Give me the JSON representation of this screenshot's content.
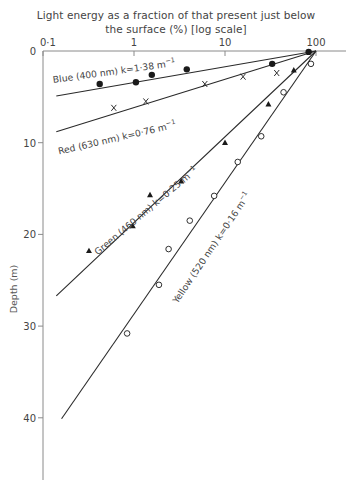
{
  "chart_data": {
    "type": "line",
    "title_lines": [
      "Light energy as a fraction of that present just below",
      "the surface (%) [log scale]"
    ],
    "xlabel": "Light energy as a fraction of that present just below the surface (%) [log scale]",
    "ylabel": "Depth (m)",
    "x_scale": "log",
    "x_axis_position": "top",
    "xlim": [
      0.1,
      100
    ],
    "ylim": [
      0,
      45
    ],
    "y_inverted": true,
    "x_ticks": [
      {
        "value": 0.1,
        "label": "0·1"
      },
      {
        "value": 1,
        "label": "1"
      },
      {
        "value": 10,
        "label": "10"
      },
      {
        "value": 100,
        "label": "100"
      }
    ],
    "y_ticks": [
      {
        "value": 0,
        "label": "0"
      },
      {
        "value": 10,
        "label": "10"
      },
      {
        "value": 20,
        "label": "20"
      },
      {
        "value": 30,
        "label": "30"
      },
      {
        "value": 40,
        "label": "40"
      }
    ],
    "grid": false,
    "legend": "inline labels along lines",
    "series": [
      {
        "name": "Blue (400 nm) k=1·38 m⁻¹",
        "label": "Blue (400 nm) k=1·38 m",
        "wavelength_nm": 400,
        "k_per_m": 1.38,
        "marker": "filled-circle",
        "fit_line": {
          "from": {
            "x": 0.14,
            "depth": 4.9
          },
          "to": {
            "x": 100,
            "depth": 0
          }
        },
        "points": [
          {
            "x": 0.42,
            "depth": 3.6
          },
          {
            "x": 1.05,
            "depth": 3.4
          },
          {
            "x": 1.57,
            "depth": 2.6
          },
          {
            "x": 3.8,
            "depth": 2.0
          },
          {
            "x": 33,
            "depth": 1.4
          },
          {
            "x": 83,
            "depth": 0.1
          }
        ]
      },
      {
        "name": "Red (630 nm) k=0·76 m⁻¹",
        "label": "Red (630 nm) k=0·76 m",
        "wavelength_nm": 630,
        "k_per_m": 0.76,
        "marker": "cross",
        "fit_line": {
          "from": {
            "x": 0.14,
            "depth": 8.8
          },
          "to": {
            "x": 100,
            "depth": 0
          }
        },
        "points": [
          {
            "x": 0.6,
            "depth": 6.2
          },
          {
            "x": 1.35,
            "depth": 5.5
          },
          {
            "x": 6.0,
            "depth": 3.6
          },
          {
            "x": 15.8,
            "depth": 2.8
          },
          {
            "x": 37,
            "depth": 2.4
          }
        ]
      },
      {
        "name": "Green (460 nm) k=0·25 m⁻¹",
        "label": "Green (460 nm) k=0·25 m",
        "wavelength_nm": 460,
        "k_per_m": 0.25,
        "marker": "filled-triangle",
        "fit_line": {
          "from": {
            "x": 0.14,
            "depth": 26.7
          },
          "to": {
            "x": 100,
            "depth": 0
          }
        },
        "points": [
          {
            "x": 0.32,
            "depth": 21.8
          },
          {
            "x": 0.97,
            "depth": 19.1
          },
          {
            "x": 1.5,
            "depth": 15.7
          },
          {
            "x": 3.3,
            "depth": 14.2
          },
          {
            "x": 10,
            "depth": 10.0
          },
          {
            "x": 30,
            "depth": 5.8
          },
          {
            "x": 57,
            "depth": 2.1
          }
        ]
      },
      {
        "name": "Yellow (520 nm) k=0·16 m⁻¹",
        "label": "Yellow (520 nm) k=0·16 m",
        "wavelength_nm": 520,
        "k_per_m": 0.16,
        "marker": "open-circle",
        "fit_line": {
          "from": {
            "x": 0.16,
            "depth": 40.1
          },
          "to": {
            "x": 100,
            "depth": 0
          }
        },
        "points": [
          {
            "x": 0.84,
            "depth": 30.8
          },
          {
            "x": 1.88,
            "depth": 25.5
          },
          {
            "x": 2.4,
            "depth": 21.6
          },
          {
            "x": 4.1,
            "depth": 18.5
          },
          {
            "x": 7.6,
            "depth": 15.8
          },
          {
            "x": 13.8,
            "depth": 12.1
          },
          {
            "x": 25,
            "depth": 9.3
          },
          {
            "x": 44,
            "depth": 4.5
          },
          {
            "x": 88,
            "depth": 1.4
          }
        ]
      }
    ],
    "annotations": [
      {
        "series": 0,
        "text": "Blue (400 nm) k=1·38 m",
        "sup": "−1",
        "at": {
          "x": 0.13,
          "depth": 3.5
        },
        "angle": -8
      },
      {
        "series": 1,
        "text": "Red (630 nm) k=0·76 m",
        "sup": "−1",
        "at": {
          "x": 0.15,
          "depth": 11.3
        },
        "angle": -13
      },
      {
        "series": 2,
        "text": "Green (460 nm) k=0·25 m",
        "sup": "−1",
        "at": {
          "x": 0.4,
          "depth": 22.3
        },
        "angle": -40
      },
      {
        "series": 3,
        "text": "Yellow (520 nm) k=0·16 m",
        "sup": "−1",
        "at": {
          "x": 3.0,
          "depth": 27.6
        },
        "angle": -56
      }
    ]
  },
  "layout": {
    "plot_px": {
      "x_left": 43,
      "decade_px": 91,
      "y_top": 51,
      "px_per_m": 9.17,
      "y_axis_bottom": 480,
      "x_axis_right": 346
    },
    "colors": {
      "axis": "#8a8a8a",
      "line": "#2a2a2a",
      "text": "#444444",
      "marker": "#1a1a1a"
    }
  }
}
